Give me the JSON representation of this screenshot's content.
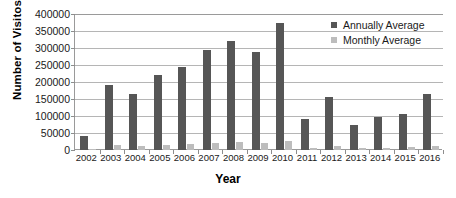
{
  "chart_data": {
    "type": "bar",
    "title": "",
    "xlabel": "Year",
    "ylabel": "Number of Visitos",
    "ylim": [
      0,
      400000
    ],
    "ytick_step": 50000,
    "yticks": [
      "400000",
      "350000",
      "300000",
      "250000",
      "200000",
      "150000",
      "100000",
      "50000",
      "0"
    ],
    "grid": true,
    "legend_position": "top-right",
    "categories": [
      "2002",
      "2003",
      "2004",
      "2005",
      "2006",
      "2007",
      "2008",
      "2009",
      "2010",
      "2011",
      "2012",
      "2013",
      "2014",
      "2015",
      "2016"
    ],
    "series": [
      {
        "name": "Annually Average",
        "color": "#565656",
        "values": [
          40000,
          190000,
          166000,
          222000,
          243000,
          293000,
          320000,
          287000,
          375000,
          92000,
          156000,
          74000,
          97000,
          107000,
          165000
        ]
      },
      {
        "name": "Monthly Average",
        "color": "#bdbdbd",
        "values": [
          2000,
          15000,
          12000,
          16000,
          19000,
          22000,
          24000,
          21000,
          27000,
          6000,
          11000,
          5000,
          7000,
          8000,
          13000
        ]
      }
    ]
  },
  "legend": {
    "items": [
      {
        "label": "Annually Average",
        "marker": "square-swatch-dark"
      },
      {
        "label": "Monthly Average",
        "marker": "square-swatch-light"
      }
    ]
  }
}
